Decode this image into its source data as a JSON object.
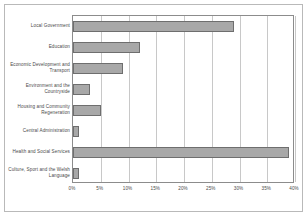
{
  "chart_data": {
    "type": "bar",
    "orientation": "horizontal",
    "title": "",
    "xlabel": "",
    "ylabel": "",
    "xlim": [
      0,
      40
    ],
    "xticks": [
      0,
      5,
      10,
      15,
      20,
      25,
      30,
      35,
      40
    ],
    "xtick_labels": [
      "0%",
      "5%",
      "10%",
      "15%",
      "20%",
      "25%",
      "30%",
      "35%",
      "40%"
    ],
    "grid": true,
    "legend": false,
    "units": "percent",
    "bar_color": "#a8a8a8",
    "bar_edge_color": "#6e6e6e",
    "grid_color": "#c8c8c8",
    "axis_color": "#8c8c8c",
    "categories": [
      "Local Government",
      "Education",
      "Economic Development and Transport",
      "Environment and the Countryside",
      "Housing and Community Regeneration",
      "Central Administration",
      "Health and Social Services",
      "Culture, Sport and the Welsh Language"
    ],
    "values": [
      29,
      12,
      9,
      3,
      5,
      1,
      39,
      1
    ]
  }
}
